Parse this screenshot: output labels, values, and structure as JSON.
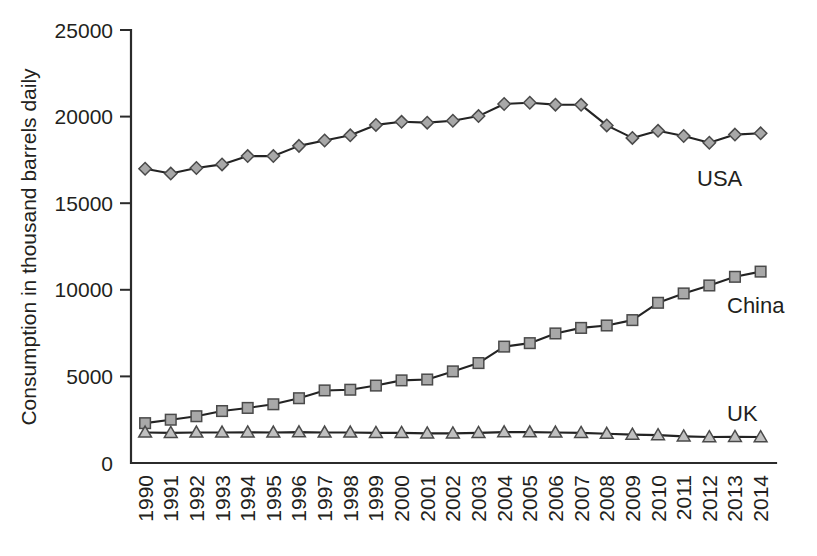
{
  "chart_data": {
    "type": "line",
    "title": "",
    "xlabel": "",
    "ylabel": "Consumption in thousand barrels daily",
    "ylim": [
      0,
      25000
    ],
    "yticks": [
      0,
      5000,
      10000,
      15000,
      20000,
      25000
    ],
    "ytick_labels": [
      "0",
      "5000",
      "10000",
      "15000",
      "20000",
      "25000"
    ],
    "grid": false,
    "legend_position": "inline-right",
    "categories": [
      "1990",
      "1991",
      "1992",
      "1993",
      "1994",
      "1995",
      "1996",
      "1997",
      "1998",
      "1999",
      "2000",
      "2001",
      "2002",
      "2003",
      "2004",
      "2005",
      "2006",
      "2007",
      "2008",
      "2009",
      "2010",
      "2011",
      "2012",
      "2013",
      "2014"
    ],
    "series": [
      {
        "name": "USA",
        "marker": "diamond",
        "color": "#a8a8a8",
        "values": [
          16990,
          16710,
          17030,
          17240,
          17720,
          17720,
          18310,
          18620,
          18920,
          19520,
          19700,
          19650,
          19760,
          20030,
          20730,
          20800,
          20690,
          20680,
          19490,
          18770,
          19180,
          18880,
          18490,
          18960,
          19035
        ]
      },
      {
        "name": "China",
        "marker": "square",
        "color": "#a8a8a8",
        "values": [
          2300,
          2500,
          2700,
          3000,
          3180,
          3390,
          3740,
          4190,
          4230,
          4470,
          4770,
          4820,
          5290,
          5770,
          6720,
          6920,
          7480,
          7800,
          7940,
          8250,
          9250,
          9790,
          10250,
          10750,
          11050
        ]
      },
      {
        "name": "UK",
        "marker": "triangle",
        "color": "#c0c0c0",
        "values": [
          1760,
          1740,
          1760,
          1760,
          1770,
          1760,
          1780,
          1760,
          1760,
          1740,
          1740,
          1710,
          1710,
          1740,
          1780,
          1780,
          1760,
          1740,
          1690,
          1640,
          1610,
          1540,
          1500,
          1510,
          1500
        ]
      }
    ]
  },
  "series_labels": {
    "usa": "USA",
    "china": "China",
    "uk": "UK"
  }
}
